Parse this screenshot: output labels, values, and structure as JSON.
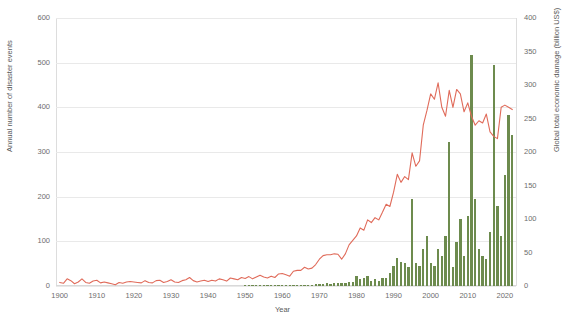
{
  "chart_data": {
    "type": "bar",
    "title": "",
    "subtitle": "",
    "xlabel": "Year",
    "ylabel": "Annual number of disaster events",
    "ylabel_right": "Global total economic damage (billion US$)",
    "xlim": [
      1899,
      2023
    ],
    "ylim": [
      0,
      600
    ],
    "ylim_right": [
      0,
      400
    ],
    "grid": true,
    "legend": "none",
    "xticks": [
      1900,
      1910,
      1920,
      1930,
      1940,
      1950,
      1960,
      1970,
      1980,
      1990,
      2000,
      2010,
      2020
    ],
    "yticks": [
      0,
      100,
      200,
      300,
      400,
      500,
      600
    ],
    "yticks_right": [
      0,
      50,
      100,
      150,
      200,
      250,
      300,
      350,
      400
    ],
    "colors": {
      "line": "#e06b5a",
      "bars": "#6d8b4e",
      "grid": "#e9e9e9",
      "text": "#6d6d6d",
      "background": "#ffffff"
    },
    "x": [
      1900,
      1901,
      1902,
      1903,
      1904,
      1905,
      1906,
      1907,
      1908,
      1909,
      1910,
      1911,
      1912,
      1913,
      1914,
      1915,
      1916,
      1917,
      1918,
      1919,
      1920,
      1921,
      1922,
      1923,
      1924,
      1925,
      1926,
      1927,
      1928,
      1929,
      1930,
      1931,
      1932,
      1933,
      1934,
      1935,
      1936,
      1937,
      1938,
      1939,
      1940,
      1941,
      1942,
      1943,
      1944,
      1945,
      1946,
      1947,
      1948,
      1949,
      1950,
      1951,
      1952,
      1953,
      1954,
      1955,
      1956,
      1957,
      1958,
      1959,
      1960,
      1961,
      1962,
      1963,
      1964,
      1965,
      1966,
      1967,
      1968,
      1969,
      1970,
      1971,
      1972,
      1973,
      1974,
      1975,
      1976,
      1977,
      1978,
      1979,
      1980,
      1981,
      1982,
      1983,
      1984,
      1985,
      1986,
      1987,
      1988,
      1989,
      1990,
      1991,
      1992,
      1993,
      1994,
      1995,
      1996,
      1997,
      1998,
      1999,
      2000,
      2001,
      2002,
      2003,
      2004,
      2005,
      2006,
      2007,
      2008,
      2009,
      2010,
      2011,
      2012,
      2013,
      2014,
      2015,
      2016,
      2017,
      2018,
      2019,
      2020,
      2021,
      2022
    ],
    "series": [
      {
        "name": "Annual number of disaster events",
        "axis": "left",
        "type": "line",
        "color": "#e06b5a",
        "values": [
          8,
          6,
          16,
          12,
          5,
          9,
          16,
          8,
          6,
          11,
          13,
          7,
          9,
          7,
          5,
          3,
          8,
          6,
          9,
          10,
          9,
          8,
          7,
          12,
          8,
          7,
          12,
          13,
          8,
          10,
          14,
          9,
          8,
          12,
          14,
          19,
          12,
          9,
          11,
          13,
          10,
          13,
          11,
          16,
          14,
          11,
          18,
          16,
          14,
          19,
          17,
          21,
          16,
          20,
          24,
          20,
          18,
          22,
          19,
          27,
          28,
          25,
          22,
          33,
          35,
          35,
          42,
          38,
          40,
          48,
          60,
          68,
          70,
          70,
          72,
          71,
          60,
          72,
          92,
          102,
          112,
          130,
          125,
          148,
          142,
          153,
          148,
          165,
          183,
          178,
          210,
          250,
          232,
          245,
          238,
          298,
          268,
          280,
          360,
          393,
          430,
          418,
          455,
          400,
          380,
          438,
          400,
          440,
          430,
          390,
          410,
          380,
          360,
          370,
          365,
          385,
          345,
          335,
          330,
          400,
          405,
          400,
          395
        ]
      },
      {
        "name": "Global total economic damage (billion US$)",
        "axis": "right",
        "type": "bar",
        "color": "#6d8b4e",
        "values": [
          0,
          0,
          0,
          0,
          0,
          0,
          0,
          0,
          0,
          0,
          0,
          0,
          0,
          0,
          0,
          0,
          0,
          0,
          0,
          0,
          0,
          0,
          0,
          0,
          0,
          0,
          0,
          0,
          0,
          0,
          0,
          0,
          0,
          0,
          0,
          0,
          0,
          0,
          0,
          0,
          0,
          0,
          0,
          0,
          0,
          0,
          0,
          0,
          0,
          0,
          0.5,
          0.5,
          0.5,
          1,
          1,
          1,
          0.5,
          1,
          1,
          1,
          2,
          2,
          1,
          1,
          2,
          2,
          1.5,
          2,
          2,
          3,
          3,
          3,
          4,
          3,
          5,
          5,
          5,
          5,
          6,
          6,
          15,
          10,
          12,
          15,
          8,
          10,
          8,
          12,
          12,
          20,
          30,
          42,
          36,
          35,
          28,
          130,
          35,
          30,
          55,
          75,
          35,
          30,
          55,
          45,
          75,
          215,
          28,
          65,
          100,
          45,
          105,
          345,
          130,
          55,
          45,
          40,
          80,
          330,
          120,
          75,
          165,
          255,
          225
        ]
      }
    ]
  },
  "axes": {
    "left": {
      "title": "Annual number of disaster events",
      "ticks": [
        "0",
        "100",
        "200",
        "300",
        "400",
        "500",
        "600"
      ]
    },
    "right": {
      "title": "Global total economic damage (billion US$)",
      "ticks": [
        "0",
        "50",
        "100",
        "150",
        "200",
        "250",
        "300",
        "350",
        "400"
      ]
    },
    "bottom": {
      "title": "Year",
      "ticks": [
        "1900",
        "1910",
        "1920",
        "1930",
        "1940",
        "1950",
        "1960",
        "1970",
        "1980",
        "1990",
        "2000",
        "2010",
        "2020"
      ]
    }
  }
}
